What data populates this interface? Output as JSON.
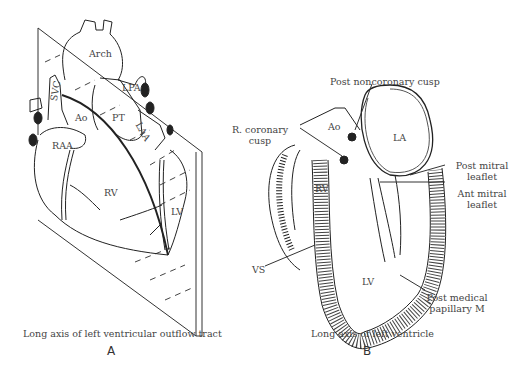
{
  "panel_a": {
    "labels": {
      "arch": "Arch",
      "lpa": "LPA",
      "svc": "SVC",
      "ao": "Ao",
      "pt": "PT",
      "laa": "LAA",
      "raa": "RAA",
      "rv": "RV",
      "lv": "LV"
    },
    "caption": "Long axis of left ventricular outflow tract",
    "letter": "A"
  },
  "panel_b": {
    "labels": {
      "post_noncoronary_cusp": "Post noncoronary cusp",
      "r_coronary_cusp_1": "R. coronary",
      "r_coronary_cusp_2": "cusp",
      "ao": "Ao",
      "la": "LA",
      "rv": "RV",
      "post_mitral_leaflet_1": "Post mitral",
      "post_mitral_leaflet_2": "leaflet",
      "ant_mitral_leaflet_1": "Ant mitral",
      "ant_mitral_leaflet_2": "leaflet",
      "vs": "VS",
      "lv": "LV",
      "post_medical_papillary_1": "Post medical",
      "post_medical_papillary_2": "papillary M"
    },
    "caption": "Long axis of left ventricle",
    "letter": "B"
  }
}
